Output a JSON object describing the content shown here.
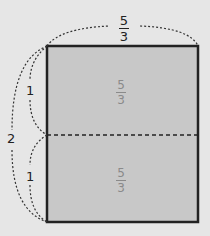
{
  "diagram": {
    "type": "rectangle split into two equal parts with dimension braces",
    "colors": {
      "background": "#e6e6e6",
      "rect_fill": "#c8c8c8",
      "stroke": "#222222",
      "inner_text": "#8a8a8a"
    },
    "top_label": {
      "numerator": "5",
      "denominator": "3"
    },
    "left_total_label": "2",
    "left_upper_label": "1",
    "left_lower_label": "1",
    "upper_area": {
      "numerator": "5",
      "denominator": "3"
    },
    "lower_area": {
      "numerator": "5",
      "denominator": "3"
    }
  }
}
